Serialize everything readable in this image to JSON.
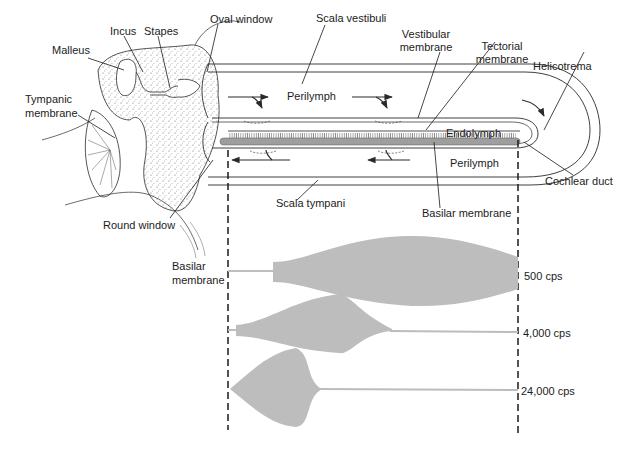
{
  "diagram": {
    "colors": {
      "line": "#2a2a2a",
      "fill_gray": "#bdbdbd",
      "basilar_dark": "#9e9e9e",
      "background": "#ffffff"
    },
    "labels": {
      "incus": "Incus",
      "stapes": "Stapes",
      "malleus": "Malleus",
      "oval_window": "Oval window",
      "scala_vestibuli": "Scala vestibuli",
      "vestibular_membrane_1": "Vestibular",
      "vestibular_membrane_2": "membrane",
      "tectorial_membrane_1": "Tectorial",
      "tectorial_membrane_2": "membrane",
      "helicotrema": "Helicotrema",
      "tympanic_membrane_1": "Tympanic",
      "tympanic_membrane_2": "membrane",
      "perilymph_upper": "Perilymph",
      "endolymph": "Endolymph",
      "perilymph_lower": "Perilymph",
      "cochlear_duct": "Cochlear duct",
      "round_window": "Round window",
      "scala_tympani": "Scala tympani",
      "basilar_membrane": "Basilar membrane",
      "basilar_membrane_side_1": "Basilar",
      "basilar_membrane_side_2": "membrane"
    },
    "envelopes": [
      {
        "frequency": "500 cps",
        "peak_position": "near apex (right)"
      },
      {
        "frequency": "4,000 cps",
        "peak_position": "middle"
      },
      {
        "frequency": "24,000 cps",
        "peak_position": "near base (left)"
      }
    ]
  }
}
